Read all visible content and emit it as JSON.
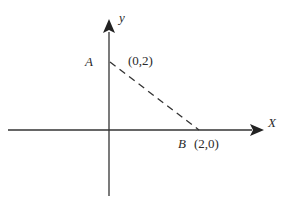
{
  "diagram": {
    "axes": {
      "x_label": "X",
      "y_label": "y"
    },
    "points": [
      {
        "name": "A",
        "coords": "(0,2)"
      },
      {
        "name": "B",
        "coords": "(2,0)"
      }
    ],
    "segment": {
      "from": "A",
      "to": "B",
      "style": "dashed"
    },
    "colors": {
      "line": "#333333",
      "background": "#ffffff"
    }
  }
}
